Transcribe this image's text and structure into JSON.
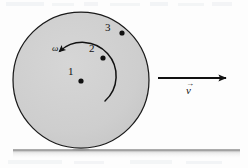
{
  "figure": {
    "type": "physics-diagram",
    "background_color": "#fdfdfd",
    "disk": {
      "fill_color": "#cfcfcf",
      "stroke_color": "#1a1a1a",
      "center_x": 81,
      "center_y": 80,
      "radius": 68
    },
    "ground": {
      "color": "#9a9a9a",
      "x_start": 13,
      "x_end": 240,
      "y": 150
    },
    "points": [
      {
        "label": "1",
        "label_x": 68,
        "label_y": 66,
        "dot_x": 81,
        "dot_y": 81,
        "dot_radius": 2.6
      },
      {
        "label": "2",
        "label_x": 89,
        "label_y": 43,
        "dot_x": 103,
        "dot_y": 58,
        "dot_radius": 2.6
      },
      {
        "label": "3",
        "label_x": 105,
        "label_y": 22,
        "dot_x": 122,
        "dot_y": 33,
        "dot_radius": 2.6
      }
    ],
    "angular_velocity": {
      "symbol": "ω",
      "label_x": 52,
      "label_y": 44,
      "direction": "counterclockwise",
      "arc_color": "#111111"
    },
    "velocity_vector": {
      "symbol": "v",
      "overbar": "→",
      "label_x": 186,
      "label_y": 86,
      "arrow_x_start": 158,
      "arrow_x_end": 228,
      "arrow_y": 78,
      "arrow_color": "#111111"
    }
  }
}
